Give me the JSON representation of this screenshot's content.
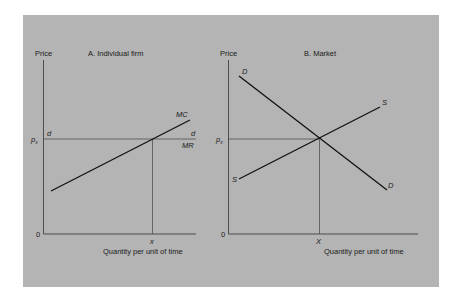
{
  "panel_a": {
    "title": "A. Individual firm",
    "y_label": "Price",
    "x_label": "Quantity per unit of time",
    "origin": "0",
    "price_tick": "p",
    "price_sub": "x",
    "qty_tick": "x",
    "mc_label": "MC",
    "d_left": "d",
    "d_right": "d",
    "mr_label": "MR"
  },
  "panel_b": {
    "title": "B. Market",
    "y_label": "Price",
    "x_label": "Quantity per unit of time",
    "origin": "0",
    "price_tick": "p",
    "price_sub": "x",
    "qty_tick": "X",
    "d_top": "D",
    "d_bottom": "D",
    "s_top": "S",
    "s_bottom": "S"
  },
  "colors": {
    "panel_bg": "#b4b4b4",
    "ink": "#1a1a1a"
  }
}
